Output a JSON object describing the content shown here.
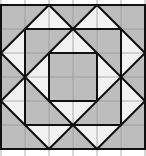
{
  "figure": {
    "grid": {
      "cols": 6,
      "rows": 6,
      "cell_px": 24,
      "origin_x": 1,
      "origin_y": 5,
      "extend_top": 5,
      "extend_bottom": 7
    },
    "colors": {
      "gray_fill": "#bdbdbd",
      "white_fill": "#f2f2f2",
      "grid_line": "#9a9a9a",
      "outline": "#111111",
      "background": "#ffffff"
    },
    "shapes": {
      "outer_square": [
        [
          0,
          0
        ],
        [
          6,
          0
        ],
        [
          6,
          6
        ],
        [
          0,
          6
        ]
      ],
      "zigzag_star": [
        [
          0,
          2
        ],
        [
          2,
          0
        ],
        [
          3,
          1
        ],
        [
          4,
          0
        ],
        [
          6,
          2
        ],
        [
          5,
          3
        ],
        [
          6,
          4
        ],
        [
          4,
          6
        ],
        [
          3,
          5
        ],
        [
          2,
          6
        ],
        [
          0,
          4
        ],
        [
          1,
          3
        ]
      ],
      "middle_square": [
        [
          1,
          1
        ],
        [
          5,
          1
        ],
        [
          5,
          5
        ],
        [
          1,
          5
        ]
      ],
      "diamond": [
        [
          3,
          1
        ],
        [
          5,
          3
        ],
        [
          3,
          5
        ],
        [
          1,
          3
        ]
      ],
      "inner_square": [
        [
          2,
          2
        ],
        [
          4,
          2
        ],
        [
          4,
          4
        ],
        [
          2,
          4
        ]
      ]
    }
  }
}
